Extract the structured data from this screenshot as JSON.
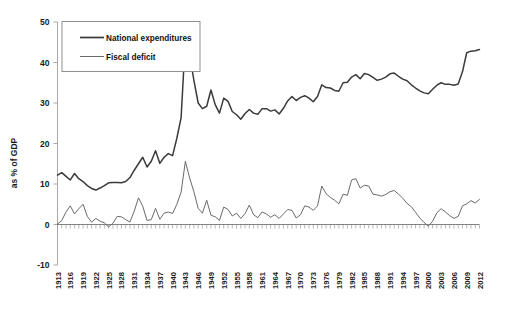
{
  "chart_data": {
    "type": "line",
    "title": "",
    "subtitle": "",
    "xlabel": "",
    "ylabel": "as % of GDP",
    "xlim": [
      1913,
      2012
    ],
    "ylim": [
      -10,
      50
    ],
    "yticks": [
      -10,
      0,
      10,
      20,
      30,
      40,
      50
    ],
    "ytick_labels": [
      "-10",
      "0",
      "10",
      "20",
      "30",
      "40",
      "50"
    ],
    "xticks": [
      1913,
      1916,
      1919,
      1922,
      1925,
      1928,
      1931,
      1934,
      1937,
      1940,
      1943,
      1946,
      1949,
      1952,
      1955,
      1958,
      1961,
      1964,
      1967,
      1970,
      1973,
      1976,
      1979,
      1982,
      1985,
      1988,
      1991,
      1994,
      1997,
      2000,
      2003,
      2006,
      2009,
      2012
    ],
    "xtick_labels": [
      "1913",
      "1916",
      "1919",
      "1922",
      "1925",
      "1928",
      "1931",
      "1934",
      "1937",
      "1940",
      "1943",
      "1946",
      "1949",
      "1952",
      "1955",
      "1958",
      "1961",
      "1964",
      "1967",
      "1970",
      "1973",
      "1976",
      "1979",
      "1982",
      "1985",
      "1988",
      "1991",
      "1994",
      "1997",
      "2000",
      "2003",
      "2006",
      "2009",
      "2012"
    ],
    "grid": false,
    "legend_position": "top-left",
    "zero_reference_line": 0,
    "x": [
      1913,
      1914,
      1915,
      1916,
      1917,
      1918,
      1919,
      1920,
      1921,
      1922,
      1923,
      1924,
      1925,
      1926,
      1927,
      1928,
      1929,
      1930,
      1931,
      1932,
      1933,
      1934,
      1935,
      1936,
      1937,
      1938,
      1939,
      1940,
      1941,
      1942,
      1943,
      1944,
      1945,
      1946,
      1947,
      1948,
      1949,
      1950,
      1951,
      1952,
      1953,
      1954,
      1955,
      1956,
      1957,
      1958,
      1959,
      1960,
      1961,
      1962,
      1963,
      1964,
      1965,
      1966,
      1967,
      1968,
      1969,
      1970,
      1971,
      1972,
      1973,
      1974,
      1975,
      1976,
      1977,
      1978,
      1979,
      1980,
      1981,
      1982,
      1983,
      1984,
      1985,
      1986,
      1987,
      1988,
      1989,
      1990,
      1991,
      1992,
      1993,
      1994,
      1995,
      1996,
      1997,
      1998,
      1999,
      2000,
      2001,
      2002,
      2003,
      2004,
      2005,
      2006,
      2007,
      2008,
      2009,
      2010,
      2011,
      2012
    ],
    "series": [
      {
        "name": "National expenditures",
        "color": "#3a3a3a",
        "linewidth": 1.5,
        "values": [
          12.2,
          12.8,
          11.9,
          11.0,
          12.6,
          11.3,
          10.6,
          9.6,
          8.9,
          8.5,
          9.0,
          9.6,
          10.3,
          10.4,
          10.4,
          10.3,
          10.6,
          11.6,
          13.4,
          15.0,
          16.6,
          14.2,
          15.6,
          18.2,
          15.1,
          16.6,
          17.5,
          17.0,
          21.3,
          26.4,
          45.8,
          42.0,
          35.6,
          30.0,
          28.6,
          29.2,
          33.2,
          29.6,
          27.5,
          31.2,
          30.4,
          27.9,
          27.1,
          26.0,
          27.4,
          28.4,
          27.5,
          27.2,
          28.6,
          28.6,
          28.0,
          28.3,
          27.3,
          28.7,
          30.5,
          31.6,
          30.6,
          31.4,
          31.8,
          31.2,
          30.3,
          31.6,
          34.5,
          33.8,
          33.7,
          33.1,
          32.9,
          35.0,
          35.1,
          36.4,
          37.0,
          36.0,
          37.3,
          37.0,
          36.3,
          35.6,
          35.9,
          36.4,
          37.2,
          37.4,
          36.6,
          35.9,
          35.5,
          34.5,
          33.7,
          33.0,
          32.5,
          32.3,
          33.4,
          34.4,
          35.0,
          34.6,
          34.6,
          34.4,
          34.7,
          37.7,
          42.4,
          42.8,
          42.9,
          43.2
        ]
      },
      {
        "name": "Fiscal deficit",
        "color": "#6a6a6a",
        "linewidth": 1.0,
        "values": [
          0.1,
          1.0,
          3.1,
          4.6,
          2.6,
          3.9,
          5.0,
          2.0,
          0.6,
          1.5,
          0.8,
          0.4,
          -0.6,
          0.3,
          2.0,
          1.9,
          1.2,
          0.6,
          3.3,
          6.6,
          4.5,
          1.0,
          1.2,
          4.0,
          1.3,
          2.8,
          3.1,
          2.7,
          5.0,
          8.0,
          15.6,
          11.5,
          8.1,
          4.0,
          2.8,
          6.0,
          2.3,
          1.9,
          1.0,
          4.3,
          3.7,
          2.1,
          2.8,
          1.5,
          2.7,
          4.8,
          2.4,
          1.7,
          3.1,
          2.6,
          1.8,
          2.4,
          1.5,
          2.6,
          3.7,
          3.5,
          1.6,
          2.4,
          4.6,
          4.3,
          3.5,
          4.6,
          9.5,
          7.6,
          6.7,
          6.0,
          5.1,
          7.5,
          7.2,
          11.0,
          11.3,
          9.0,
          9.7,
          9.5,
          7.5,
          7.3,
          7.0,
          7.4,
          8.1,
          8.4,
          7.5,
          6.5,
          5.2,
          4.4,
          3.0,
          1.6,
          0.5,
          -0.4,
          0.8,
          2.9,
          3.9,
          3.1,
          2.2,
          1.5,
          2.0,
          4.6,
          5.1,
          5.9,
          5.3,
          6.2
        ]
      }
    ]
  },
  "legend": {
    "items": [
      {
        "label": "National expenditures"
      },
      {
        "label": "Fiscal deficit"
      }
    ]
  },
  "axes": {
    "y_title": "as % of GDP"
  }
}
